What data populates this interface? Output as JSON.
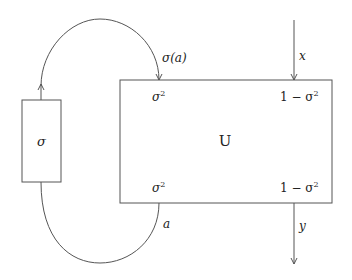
{
  "diagram": {
    "colors": {
      "stroke": "#555555",
      "text": "#222222",
      "background": "#ffffff"
    },
    "sigma_box": {
      "label": "σ"
    },
    "u_box": {
      "label": "U",
      "corners": {
        "top_left": "σ",
        "top_left_sup": "2",
        "top_right_prefix": "1 − σ",
        "top_right_sup": "2",
        "bottom_left": "σ",
        "bottom_left_sup": "2",
        "bottom_right_prefix": "1 − σ",
        "bottom_right_sup": "2"
      }
    },
    "edges": {
      "top_arc_label": "σ(a)",
      "bottom_arc_label": "a",
      "input_label": "x",
      "output_label": "y"
    }
  }
}
